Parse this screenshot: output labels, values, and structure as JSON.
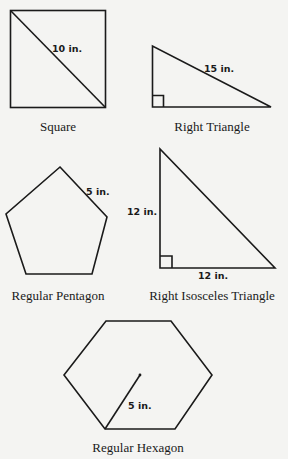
{
  "figures": [
    {
      "id": "square",
      "caption": "Square",
      "measurement": "10 in.",
      "measurement_refers_to": "diagonal"
    },
    {
      "id": "right-triangle",
      "caption": "Right Triangle",
      "measurement": "15 in.",
      "measurement_refers_to": "hypotenuse"
    },
    {
      "id": "regular-pentagon",
      "caption": "Regular Pentagon",
      "measurement": "5 in.",
      "measurement_refers_to": "side"
    },
    {
      "id": "right-isosceles-triangle",
      "caption": "Right Isosceles Triangle",
      "measurements": [
        "12 in.",
        "12 in."
      ],
      "measurement_refers_to": "legs"
    },
    {
      "id": "regular-hexagon",
      "caption": "Regular Hexagon",
      "measurement": "5 in.",
      "measurement_refers_to": "radius"
    }
  ],
  "colors": {
    "background": "#f4f4f2",
    "ink": "#1a1a1a"
  }
}
